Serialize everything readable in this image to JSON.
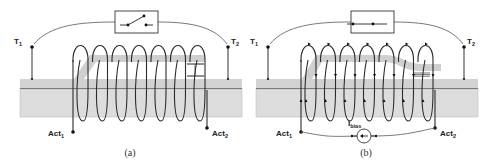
{
  "figure": {
    "panels": [
      {
        "id": "a",
        "caption": "(a)",
        "terminal_left": {
          "main": "T",
          "sub": "1"
        },
        "terminal_right": {
          "main": "T",
          "sub": "2"
        },
        "actuator_left": {
          "main": "Act",
          "sub": "1"
        },
        "actuator_right": {
          "main": "Act",
          "sub": "2"
        },
        "switch_state": "open",
        "coil_turns": 7,
        "current_arrows": false
      },
      {
        "id": "b",
        "caption": "(b)",
        "terminal_left": {
          "main": "T",
          "sub": "1"
        },
        "terminal_right": {
          "main": "T",
          "sub": "2"
        },
        "actuator_left": {
          "main": "Act",
          "sub": "1"
        },
        "actuator_right": {
          "main": "Act",
          "sub": "2"
        },
        "switch_state": "closed",
        "coil_turns": 7,
        "current_arrows": true,
        "bias_source": {
          "main": "I",
          "sub": "bias"
        }
      }
    ],
    "colors": {
      "substrate": "#dcdcdc",
      "substrate_top": "#d2d2d2",
      "beam": "#cfcfcf",
      "line": "#2b2b2b"
    }
  }
}
